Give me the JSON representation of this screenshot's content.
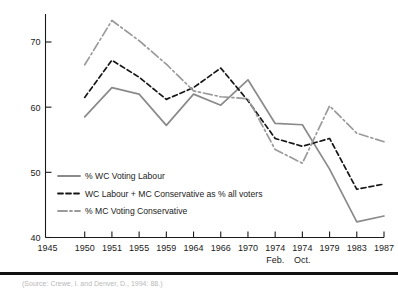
{
  "figure": {
    "background": "#ffffff",
    "caption": "(Source: Crewe, I. and Denver, D., 1994: 88.)"
  },
  "colors": {
    "labour_line": "#8a8a8a",
    "combined_line": "#161616",
    "conservative_line": "#9a9a9a",
    "axis": "#1b1b1b",
    "rule": "#111111"
  },
  "chart_data": {
    "type": "line",
    "title": "",
    "xlabel": "",
    "ylabel": "",
    "ylim": [
      40,
      75
    ],
    "yticks": [
      40,
      50,
      60,
      70
    ],
    "ytick_labels": [
      "40",
      "50",
      "60",
      "70"
    ],
    "grid": false,
    "legend_position": "inside-lower-left",
    "categories": [
      "1945",
      "1950",
      "1951",
      "1955",
      "1959",
      "1964",
      "1966",
      "1970",
      "1974",
      "1974",
      "1979",
      "1983",
      "1987"
    ],
    "category_sublabels": [
      "",
      "",
      "",
      "",
      "",
      "",
      "",
      "",
      "Feb.",
      "Oct.",
      "",
      "",
      ""
    ],
    "x": [
      1945,
      1950,
      1951,
      1955,
      1959,
      1964,
      1966,
      1970,
      1974.1,
      1974.8,
      1979,
      1983,
      1987
    ],
    "series": [
      {
        "name": "% WC Voting Labour",
        "style": "solid",
        "color": "#8a8a8a",
        "values": [
          null,
          58.5,
          63.0,
          62.0,
          57.2,
          62.0,
          60.3,
          64.2,
          57.5,
          57.3,
          50.5,
          42.4,
          43.3
        ]
      },
      {
        "name": "WC Labour + MC Conservative as % all voters",
        "style": "dashed",
        "color": "#161616",
        "values": [
          null,
          61.5,
          67.2,
          64.6,
          61.2,
          63.0,
          66.0,
          61.0,
          55.2,
          54.0,
          55.2,
          47.4,
          48.2
        ]
      },
      {
        "name": "% MC Voting Conservative",
        "style": "dashdot",
        "color": "#9a9a9a",
        "values": [
          null,
          66.5,
          73.3,
          70.2,
          66.6,
          62.5,
          61.6,
          61.3,
          53.5,
          51.4,
          60.2,
          56.0,
          54.7
        ]
      }
    ]
  },
  "legend": {
    "items": [
      {
        "label": "% WC Voting Labour",
        "style": "solid",
        "color": "#8a8a8a"
      },
      {
        "label": "WC Labour + MC Conservative as % all voters",
        "style": "dashed",
        "color": "#161616"
      },
      {
        "label": "% MC Voting Conservative",
        "style": "dashdot",
        "color": "#9a9a9a"
      }
    ]
  }
}
